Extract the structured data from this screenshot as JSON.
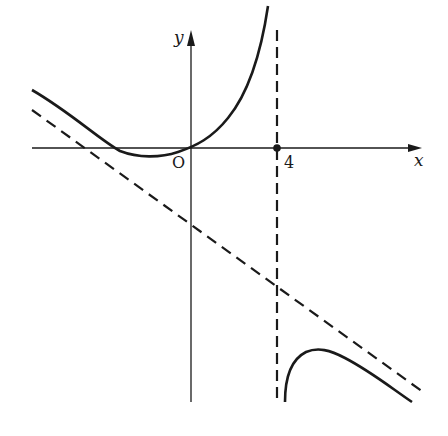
{
  "figure": {
    "type": "function-graph",
    "labels": {
      "x_axis": "x",
      "y_axis": "y",
      "origin": "O",
      "asymptote_x_value": "4"
    },
    "colors": {
      "ink": "#1a1a1a",
      "background": "#ffffff"
    },
    "elements": {
      "x_axis": "horizontal axis with arrow pointing right",
      "y_axis": "vertical axis with arrow pointing up",
      "vertical_asymptote": "dashed line x = 4",
      "oblique_asymptote": "dashed line with negative slope",
      "left_branch": "curve decreasing from upper-left, minimum just left of origin, rising steeply toward x = 4",
      "right_branch": "curve rising from below near x = 4, local maximum, then decreasing along oblique asymptote",
      "marked_point": "filled dot at (4, 0)"
    }
  }
}
